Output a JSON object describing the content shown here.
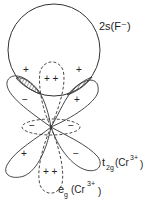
{
  "diagram": {
    "labels": {
      "fluoride_orbital": "2s(F⁻)",
      "t2g_main": "t",
      "t2g_sub": "2g",
      "t2g_ion": "(Cr",
      "t2g_charge": "3+",
      "t2g_close": ")",
      "eg_main": "e",
      "eg_sub": "g",
      "eg_ion": "(Cr",
      "eg_charge": "3+",
      "eg_close": ")"
    },
    "signs": {
      "circle_left": "+",
      "circle_right": "+",
      "eg_top": "+ +",
      "t2g_upper_left": "−",
      "t2g_upper_right": "+",
      "eg_ring_left": "−",
      "eg_ring_right": "−",
      "t2g_lower_left": "+",
      "t2g_lower_right": "−",
      "eg_bottom": "+ +"
    }
  }
}
